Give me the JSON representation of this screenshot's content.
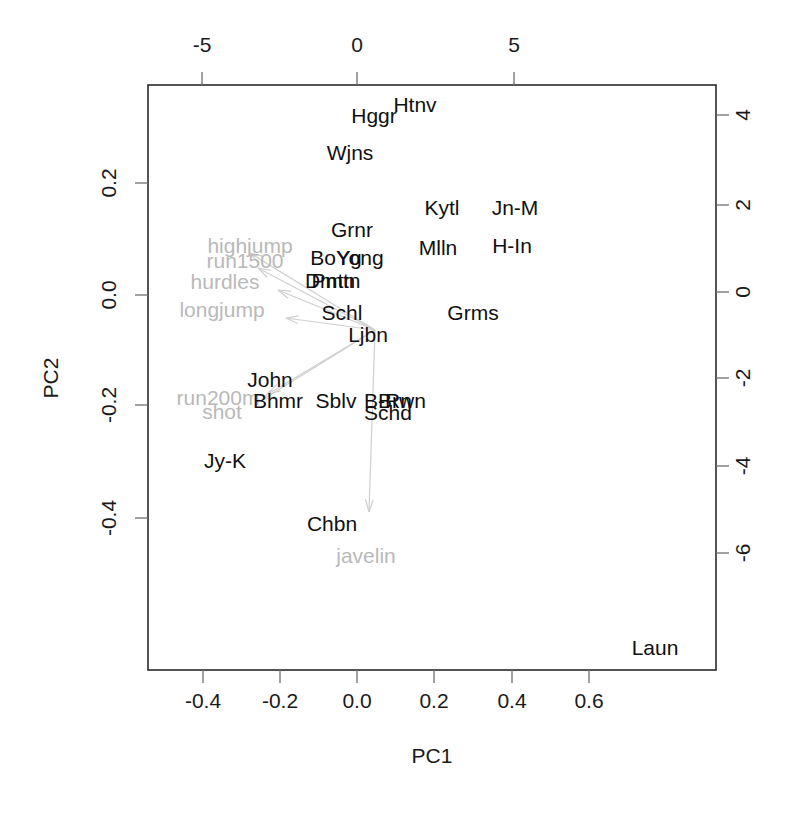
{
  "figure": {
    "type": "pca-biplot",
    "background": "#ffffff",
    "frame_color": "#2b2b2b",
    "point_label_color": "#101010",
    "loading_color": "#c0c0c0"
  },
  "axes": {
    "bottom": {
      "label": "PC1",
      "ticks": [
        "-0.4",
        "-0.2",
        "0.0",
        "0.2",
        "0.4",
        "0.6"
      ],
      "tick_px": [
        203,
        280,
        357,
        434,
        512,
        589
      ],
      "range": [
        -0.52,
        0.68
      ]
    },
    "left": {
      "label": "PC2",
      "ticks": [
        "0.2",
        "0.0",
        "-0.2",
        "-0.4"
      ],
      "tick_px": [
        183,
        295,
        405,
        518
      ],
      "range": [
        -0.52,
        0.3
      ]
    },
    "top": {
      "label": "",
      "ticks": [
        "-5",
        "0",
        "5"
      ],
      "tick_px": [
        202,
        357,
        514
      ],
      "range": [
        -10.4,
        11.6
      ]
    },
    "right": {
      "label": "",
      "ticks": [
        "4",
        "2",
        "0",
        "-2",
        "-4",
        "-6"
      ],
      "tick_px": [
        115,
        205,
        292,
        378,
        466,
        553
      ],
      "range": [
        -9.5,
        5.5
      ]
    }
  },
  "plot_box": {
    "x": 148,
    "y": 85,
    "width": 568,
    "height": 585
  },
  "chart_data": {
    "type": "scatter",
    "title": "",
    "xlabel": "PC1",
    "ylabel": "PC2",
    "xlim": [
      -0.52,
      0.68
    ],
    "ylim": [
      -0.52,
      0.3
    ],
    "grid": false,
    "legend": "none",
    "secondary_xlim": [
      -10.4,
      11.6
    ],
    "secondary_ylim": [
      -9.5,
      5.5
    ],
    "points": [
      {
        "label": "Htnv",
        "px": 415,
        "py": 112,
        "x": 0.03,
        "y": 0.279
      },
      {
        "label": "Hggr",
        "px": 374,
        "py": 123,
        "x": -0.075,
        "y": 0.259
      },
      {
        "label": "Wjns",
        "px": 350,
        "py": 160,
        "x": -0.137,
        "y": 0.193
      },
      {
        "label": "Kytl",
        "px": 442,
        "py": 215,
        "x": 0.102,
        "y": 0.095
      },
      {
        "label": "Jn-M",
        "px": 515,
        "py": 215,
        "x": 0.291,
        "y": 0.095
      },
      {
        "label": "Grnr",
        "px": 352,
        "py": 237,
        "x": -0.132,
        "y": 0.056
      },
      {
        "label": "Mlln",
        "px": 438,
        "py": 255,
        "x": 0.091,
        "y": 0.023
      },
      {
        "label": "H-In",
        "px": 512,
        "py": 253,
        "x": 0.283,
        "y": 0.027
      },
      {
        "label": "BoYg",
        "px": 336,
        "py": 265,
        "x": -0.173,
        "y": 0.006
      },
      {
        "label": "Yong",
        "px": 360,
        "py": 265,
        "x": -0.111,
        "y": 0.006
      },
      {
        "label": "Dmtn",
        "px": 330,
        "py": 288,
        "x": -0.189,
        "y": -0.035
      },
      {
        "label": "Pmtn",
        "px": 336,
        "py": 288,
        "x": -0.173,
        "y": -0.035
      },
      {
        "label": "Schl",
        "px": 342,
        "py": 320,
        "x": -0.158,
        "y": -0.092
      },
      {
        "label": "Grms",
        "px": 473,
        "py": 320,
        "x": 0.182,
        "y": -0.092
      },
      {
        "label": "Ljbn",
        "px": 368,
        "py": 342,
        "x": -0.091,
        "y": -0.131
      },
      {
        "label": "John",
        "px": 270,
        "py": 387,
        "x": -0.345,
        "y": -0.211
      },
      {
        "label": "Bhmr",
        "px": 278,
        "py": 408,
        "x": -0.325,
        "y": -0.249
      },
      {
        "label": "Sblv",
        "px": 336,
        "py": 408,
        "x": -0.173,
        "y": -0.249
      },
      {
        "label": "Brwn",
        "px": 402,
        "py": 408,
        "x": -0.002,
        "y": -0.249
      },
      {
        "label": "B-Rn",
        "px": 388,
        "py": 408,
        "x": -0.039,
        "y": -0.249
      },
      {
        "label": "Schd",
        "px": 388,
        "py": 420,
        "x": -0.039,
        "y": -0.27
      },
      {
        "label": "Jy-K",
        "px": 225,
        "py": 468,
        "x": -0.462,
        "y": -0.355
      },
      {
        "label": "Chbn",
        "px": 332,
        "py": 531,
        "x": -0.184,
        "y": -0.467
      },
      {
        "label": "Laun",
        "px": 655,
        "py": 655,
        "x": 0.655,
        "y": -0.687
      }
    ],
    "loadings": [
      {
        "label": "highjump",
        "tip_px": 250,
        "tip_py": 253,
        "lbl_px": 250,
        "lbl_py": 253
      },
      {
        "label": "run1500",
        "tip_px": 258,
        "tip_py": 268,
        "lbl_px": 245,
        "lbl_py": 268
      },
      {
        "label": "hurdles",
        "tip_px": 278,
        "tip_py": 290,
        "lbl_px": 225,
        "lbl_py": 289
      },
      {
        "label": "longjump",
        "tip_px": 286,
        "tip_py": 318,
        "lbl_px": 222,
        "lbl_py": 317
      },
      {
        "label": "run200m",
        "tip_px": 268,
        "tip_py": 394,
        "lbl_px": 218,
        "lbl_py": 405
      },
      {
        "label": "shot",
        "tip_px": 262,
        "tip_py": 400,
        "lbl_px": 222,
        "lbl_py": 419
      },
      {
        "label": "javelin",
        "tip_px": 369,
        "tip_py": 512,
        "lbl_px": 366,
        "lbl_py": 563
      }
    ],
    "loading_origin": {
      "px": 375,
      "py": 330
    }
  }
}
